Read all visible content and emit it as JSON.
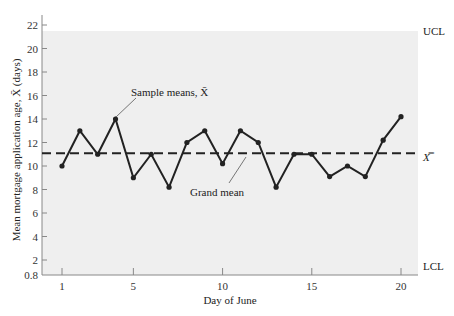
{
  "chart_data": {
    "type": "line",
    "title": "",
    "xlabel": "Day of June",
    "ylabel": "Mean mortgage application age, X̄ (days)",
    "x": [
      1,
      2,
      3,
      4,
      5,
      6,
      7,
      8,
      9,
      10,
      11,
      12,
      13,
      14,
      15,
      16,
      17,
      18,
      19,
      20
    ],
    "series": [
      {
        "name": "Sample means, X̄",
        "values": [
          10,
          13,
          11,
          14,
          9,
          11,
          8.2,
          12,
          13,
          10.2,
          13,
          12,
          8.2,
          11,
          11,
          9.1,
          10,
          9.1,
          12.2,
          14.2
        ]
      }
    ],
    "reference_lines": [
      {
        "name": "Grand mean",
        "label": "X̿",
        "value": 11,
        "style": "dashed"
      },
      {
        "name": "UCL",
        "label": "UCL",
        "value": 20.5
      },
      {
        "name": "LCL",
        "label": "LCL",
        "value": 0.8
      }
    ],
    "x_ticks": [
      1,
      5,
      10,
      15,
      20
    ],
    "y_ticks": [
      0.8,
      2,
      4,
      6,
      8,
      10,
      12,
      14,
      16,
      18,
      20,
      22
    ],
    "xlim": [
      0.2,
      20.8
    ],
    "ylim": [
      0.8,
      22
    ],
    "grid": false,
    "annotations": [
      "Sample means, X̄",
      "Grand mean"
    ]
  },
  "labels": {
    "xlabel": "Day of June",
    "ylabel": "Mean mortgage application age, X̄ (days)",
    "ucl": "UCL",
    "lcl": "LCL",
    "grand_mean_symbol": "X̿",
    "sample_means": "Sample means, X̄",
    "grand_mean": "Grand mean"
  },
  "colors": {
    "plot_bg": "#efefef",
    "line": "#222222",
    "axis": "#888888"
  }
}
